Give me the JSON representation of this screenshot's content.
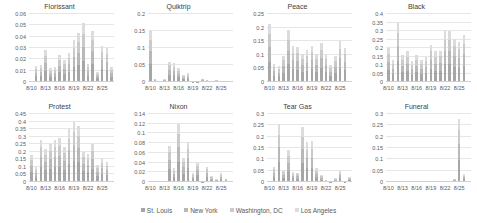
{
  "legend": [
    {
      "name": "St. Louis",
      "color": "#a6a6a6"
    },
    {
      "name": "New York",
      "color": "#b8b8b8"
    },
    {
      "name": "Washington, DC",
      "color": "#cacaca"
    },
    {
      "name": "Los Angeles",
      "color": "#dcdcdc"
    }
  ],
  "chart_data": [
    {
      "type": "bar",
      "stacked": true,
      "title": "Florissant",
      "categories": [
        "8/10",
        "8/11",
        "8/12",
        "8/13",
        "8/14",
        "8/15",
        "8/16",
        "8/17",
        "8/18",
        "8/19",
        "8/20",
        "8/21",
        "8/22",
        "8/23",
        "8/24",
        "8/25",
        "8/26",
        "8/27"
      ],
      "xticks": [
        "8/10",
        "8/13",
        "8/16",
        "8/19",
        "8/22",
        "8/25"
      ],
      "ylim": [
        0,
        0.06
      ],
      "yticks": [
        "0",
        "0.01",
        "0.02",
        "0.03",
        "0.04",
        "0.05",
        "0.06"
      ],
      "values": [
        0,
        0.014,
        0.015,
        0.028,
        0.012,
        0.013,
        0.024,
        0.019,
        0.026,
        0.037,
        0.043,
        0.052,
        0.016,
        0.045,
        0.009,
        0.032,
        0.03,
        0.013
      ]
    },
    {
      "type": "bar",
      "stacked": true,
      "title": "Quiktrip",
      "categories": [
        "8/10",
        "8/11",
        "8/12",
        "8/13",
        "8/14",
        "8/15",
        "8/16",
        "8/17",
        "8/18",
        "8/19",
        "8/20",
        "8/21",
        "8/22",
        "8/23",
        "8/24",
        "8/25",
        "8/26",
        "8/27"
      ],
      "xticks": [
        "8/10",
        "8/13",
        "8/16",
        "8/19",
        "8/22",
        "8/25"
      ],
      "ylim": [
        0,
        0.2
      ],
      "yticks": [
        "0",
        "0.05",
        "0.1",
        "0.15",
        "0.2"
      ],
      "values": [
        0.15,
        0.01,
        0,
        0.008,
        0.06,
        0.055,
        0.04,
        0.022,
        0.027,
        0.004,
        0.004,
        0.01,
        0.006,
        0,
        0.007,
        0,
        0,
        0
      ]
    },
    {
      "type": "bar",
      "stacked": true,
      "title": "Peace",
      "categories": [
        "8/10",
        "8/11",
        "8/12",
        "8/13",
        "8/14",
        "8/15",
        "8/16",
        "8/17",
        "8/18",
        "8/19",
        "8/20",
        "8/21",
        "8/22",
        "8/23",
        "8/24",
        "8/25",
        "8/26",
        "8/27"
      ],
      "xticks": [
        "8/10",
        "8/13",
        "8/16",
        "8/19",
        "8/22",
        "8/25"
      ],
      "ylim": [
        0,
        0.25
      ],
      "yticks": [
        "0",
        "0.05",
        "0.1",
        "0.15",
        "0.2",
        "0.25"
      ],
      "values": [
        0.215,
        0.067,
        0.058,
        0.097,
        0.19,
        0.132,
        0.13,
        0.105,
        0.118,
        0.133,
        0.103,
        0.145,
        0.105,
        0.064,
        0.095,
        0.15,
        0.125,
        0
      ]
    },
    {
      "type": "bar",
      "stacked": true,
      "title": "Black",
      "categories": [
        "8/10",
        "8/11",
        "8/12",
        "8/13",
        "8/14",
        "8/15",
        "8/16",
        "8/17",
        "8/18",
        "8/19",
        "8/20",
        "8/21",
        "8/22",
        "8/23",
        "8/24",
        "8/25",
        "8/26",
        "8/27"
      ],
      "xticks": [
        "8/10",
        "8/13",
        "8/16",
        "8/19",
        "8/22",
        "8/25"
      ],
      "ylim": [
        0,
        0.4
      ],
      "yticks": [
        "0",
        "0.05",
        "0.1",
        "0.15",
        "0.2",
        "0.25",
        "0.3",
        "0.35",
        "0.4"
      ],
      "values": [
        0.2,
        0.13,
        0.35,
        0.16,
        0.18,
        0.125,
        0.16,
        0.13,
        0.15,
        0.22,
        0.18,
        0.185,
        0.305,
        0.3,
        0.255,
        0.235,
        0.275,
        0
      ]
    },
    {
      "type": "bar",
      "stacked": true,
      "title": "Protest",
      "categories": [
        "8/10",
        "8/11",
        "8/12",
        "8/13",
        "8/14",
        "8/15",
        "8/16",
        "8/17",
        "8/18",
        "8/19",
        "8/20",
        "8/21",
        "8/22",
        "8/23",
        "8/24",
        "8/25",
        "8/26",
        "8/27"
      ],
      "xticks": [
        "8/10",
        "8/13",
        "8/16",
        "8/19",
        "8/22",
        "8/25"
      ],
      "ylim": [
        0,
        0.45
      ],
      "yticks": [
        "0",
        "0.05",
        "0.1",
        "0.15",
        "0.2",
        "0.25",
        "0.3",
        "0.35",
        "0.4",
        "0.45"
      ],
      "values": [
        0.18,
        0.1,
        0.28,
        0.22,
        0.25,
        0.28,
        0.29,
        0.235,
        0.35,
        0.4,
        0.37,
        0.2,
        0.185,
        0.25,
        0.11,
        0.15,
        0.13,
        0
      ]
    },
    {
      "type": "bar",
      "stacked": true,
      "title": "Nixon",
      "categories": [
        "8/10",
        "8/11",
        "8/12",
        "8/13",
        "8/14",
        "8/15",
        "8/16",
        "8/17",
        "8/18",
        "8/19",
        "8/20",
        "8/21",
        "8/22",
        "8/23",
        "8/24",
        "8/25",
        "8/26",
        "8/27"
      ],
      "xticks": [
        "8/10",
        "8/13",
        "8/16",
        "8/19",
        "8/22",
        "8/25"
      ],
      "ylim": [
        0,
        0.14
      ],
      "yticks": [
        "0",
        "0.02",
        "0.04",
        "0.06",
        "0.08",
        "0.1",
        "0.12",
        "0.14"
      ],
      "values": [
        0,
        0,
        0,
        0,
        0.075,
        0.028,
        0.12,
        0.05,
        0.082,
        0.018,
        0.04,
        0.002,
        0.032,
        0.012,
        0.006,
        0.018,
        0.007,
        0
      ]
    },
    {
      "type": "bar",
      "stacked": true,
      "title": "Tear Gas",
      "categories": [
        "8/10",
        "8/11",
        "8/12",
        "8/13",
        "8/14",
        "8/15",
        "8/16",
        "8/17",
        "8/18",
        "8/19",
        "8/20",
        "8/21",
        "8/22",
        "8/23",
        "8/24",
        "8/25",
        "8/26",
        "8/27"
      ],
      "xticks": [
        "8/10",
        "8/13",
        "8/16",
        "8/19",
        "8/22",
        "8/25"
      ],
      "ylim": [
        0,
        0.3
      ],
      "yticks": [
        "0",
        "0.05",
        "0.1",
        "0.15",
        "0.2",
        "0.25",
        "0.3"
      ],
      "values": [
        0,
        0.068,
        0.255,
        0.052,
        0.14,
        0.045,
        0.042,
        0.245,
        0.175,
        0.18,
        0.062,
        0.03,
        0.01,
        0.002,
        0.018,
        0.048,
        0.005,
        0.022
      ]
    },
    {
      "type": "bar",
      "stacked": true,
      "title": "Funeral",
      "categories": [
        "8/10",
        "8/11",
        "8/12",
        "8/13",
        "8/14",
        "8/15",
        "8/16",
        "8/17",
        "8/18",
        "8/19",
        "8/20",
        "8/21",
        "8/22",
        "8/23",
        "8/24",
        "8/25",
        "8/26",
        "8/27"
      ],
      "xticks": [
        "8/10",
        "8/13",
        "8/16",
        "8/19",
        "8/22",
        "8/25"
      ],
      "ylim": [
        0,
        0.3
      ],
      "yticks": [
        "0",
        "0.05",
        "0.1",
        "0.15",
        "0.2",
        "0.25",
        "0.3"
      ],
      "values": [
        0,
        0,
        0,
        0,
        0,
        0,
        0.001,
        0,
        0.001,
        0,
        0,
        0.001,
        0,
        0,
        0.015,
        0.28,
        0.035,
        0
      ]
    }
  ]
}
